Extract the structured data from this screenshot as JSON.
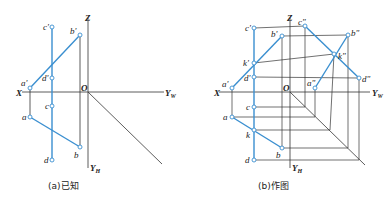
{
  "figure_a": {
    "caption": "(a)已知",
    "axes": {
      "x": "X",
      "z": "Z",
      "origin": "O",
      "yw": "Y",
      "yw_sub": "W",
      "yh": "Y",
      "yh_sub": "H"
    },
    "points": {
      "a_prime": "a'",
      "b_prime": "b'",
      "c_prime": "c'",
      "d_prime": "d'",
      "a": "a",
      "b": "b",
      "c": "c",
      "d": "d"
    }
  },
  "figure_b": {
    "caption": "(b)作图",
    "axes": {
      "x": "X",
      "z": "Z",
      "origin": "O",
      "yw": "Y",
      "yw_sub": "W",
      "yh": "Y",
      "yh_sub": "H"
    },
    "points": {
      "a_prime": "a'",
      "b_prime": "b'",
      "c_prime": "c'",
      "d_prime": "d'",
      "k_prime": "k'",
      "a_dprime": "a\"",
      "b_dprime": "b\"",
      "c_dprime": "c\"",
      "d_dprime": "d\"",
      "k_dprime": "k\"",
      "a": "a",
      "b": "b",
      "c": "c",
      "d": "d",
      "k": "k"
    }
  },
  "colors": {
    "line_blue": "#3a8fd0",
    "construction": "#333333",
    "background": "#ffffff"
  }
}
